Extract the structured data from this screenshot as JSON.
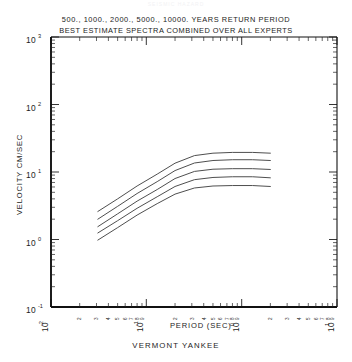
{
  "faint_header": "SEISMIC HAZARD",
  "title": {
    "line1": "500., 1000., 2000.,  5000.,  10000. YEARS RETURN PERIOD",
    "line2": "BEST ESTIMATE SPECTRA COMBINED OVER ALL EXPERTS"
  },
  "caption": "VERMONT YANKEE",
  "axes": {
    "xlabel": "PERIOD (SEC)",
    "ylabel": "VELOCITY CM/SEC",
    "x_major_labels": [
      "10",
      "10",
      "10",
      "10"
    ],
    "x_major_exponents": [
      "-2",
      "-1",
      "0",
      "1"
    ],
    "y_major_labels": [
      "10",
      "10",
      "10",
      "10",
      "10"
    ],
    "y_major_exponents": [
      "3",
      "2",
      "1",
      "0",
      "-1"
    ],
    "minor_tick_numbers": [
      "2",
      "3",
      "4",
      "5",
      "6",
      "7",
      "8",
      "9"
    ]
  },
  "chart_data": {
    "type": "line",
    "subtitle": "VERMONT YANKEE",
    "xlabel": "PERIOD (SEC)",
    "ylabel": "VELOCITY CM/SEC",
    "xscale": "log",
    "yscale": "log",
    "xlim": [
      0.01,
      10
    ],
    "ylim": [
      0.1,
      1000
    ],
    "grid": false,
    "legend": "none",
    "x_ticks": [
      0.01,
      0.1,
      1,
      10
    ],
    "y_ticks": [
      0.1,
      1,
      10,
      100,
      1000
    ],
    "series": [
      {
        "name": "10000 years return period",
        "x": [
          0.031,
          0.05,
          0.08,
          0.13,
          0.2,
          0.32,
          0.5,
          0.8,
          1.3,
          2.0
        ],
        "y": [
          2.6,
          4.0,
          6.2,
          9.3,
          13.5,
          17.5,
          19.0,
          19.5,
          19.5,
          19.0
        ]
      },
      {
        "name": "5000 years return period",
        "x": [
          0.031,
          0.05,
          0.08,
          0.13,
          0.2,
          0.32,
          0.5,
          0.8,
          1.3,
          2.0
        ],
        "y": [
          2.0,
          3.1,
          4.8,
          7.2,
          10.5,
          13.6,
          14.8,
          15.2,
          15.2,
          14.8
        ]
      },
      {
        "name": "2000 years return period",
        "x": [
          0.031,
          0.05,
          0.08,
          0.13,
          0.2,
          0.32,
          0.5,
          0.8,
          1.3,
          2.0
        ],
        "y": [
          1.55,
          2.4,
          3.7,
          5.5,
          8.0,
          10.2,
          11.0,
          11.2,
          11.2,
          10.9
        ]
      },
      {
        "name": "1000 years return period",
        "x": [
          0.031,
          0.05,
          0.08,
          0.13,
          0.2,
          0.32,
          0.5,
          0.8,
          1.3,
          2.0
        ],
        "y": [
          1.25,
          1.9,
          2.9,
          4.3,
          6.1,
          7.7,
          8.3,
          8.5,
          8.5,
          8.2
        ]
      },
      {
        "name": "500 years return period",
        "x": [
          0.031,
          0.05,
          0.08,
          0.13,
          0.2,
          0.32,
          0.5,
          0.8,
          1.3,
          2.0
        ],
        "y": [
          0.98,
          1.5,
          2.3,
          3.4,
          4.7,
          5.8,
          6.2,
          6.3,
          6.3,
          6.1
        ]
      }
    ]
  }
}
